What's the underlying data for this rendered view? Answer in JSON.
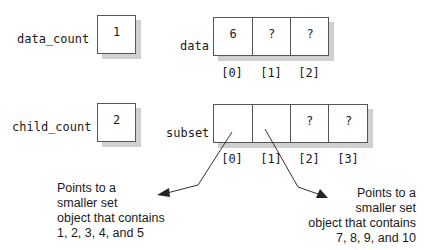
{
  "variables": {
    "data_count": {
      "label": "data_count",
      "value": "1"
    },
    "child_count": {
      "label": "child_count",
      "value": "2"
    }
  },
  "arrays": {
    "data": {
      "label": "data",
      "cells": [
        "6",
        "?",
        "?"
      ],
      "indices": [
        "[0]",
        "[1]",
        "[2]"
      ]
    },
    "subset": {
      "label": "subset",
      "cells": [
        "",
        "",
        "?",
        "?"
      ],
      "indices": [
        "[0]",
        "[1]",
        "[2]",
        "[3]"
      ]
    }
  },
  "annotations": {
    "left": {
      "lines": [
        "Points to a",
        "smaller set",
        "object that contains",
        "1, 2, 3, 4, and 5"
      ]
    },
    "right": {
      "lines": [
        "Points to a",
        "smaller set",
        "object that contains",
        "7, 8, 9, and 10"
      ]
    }
  },
  "colors": {
    "stroke": "#555555",
    "shadow": "#cfcfcf",
    "text": "#1a1a1a"
  }
}
